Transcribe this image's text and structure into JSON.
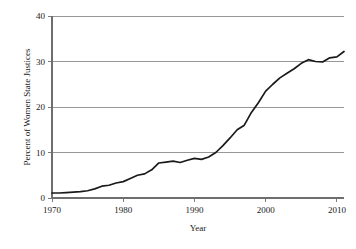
{
  "chart_data": {
    "type": "line",
    "title": "",
    "xlabel": "Year",
    "ylabel": "Percent of Women State Justices",
    "xlim": [
      1970,
      2011
    ],
    "ylim": [
      0,
      40
    ],
    "xticks": [
      1970,
      1980,
      1990,
      2000,
      2010
    ],
    "xtick_labels": [
      "1970",
      "1980",
      "1990",
      "2000",
      "2010"
    ],
    "yticks": [
      0,
      10,
      20,
      30,
      40
    ],
    "ytick_labels": [
      "0",
      "10",
      "20",
      "30",
      "40"
    ],
    "grid": "horizontal",
    "legend": "none",
    "line_color": "#1a1a1a",
    "grid_color": "#8c8c8c",
    "series": [
      {
        "name": "Percent of Women State Justices",
        "x": [
          1970,
          1971,
          1972,
          1973,
          1974,
          1975,
          1976,
          1977,
          1978,
          1979,
          1980,
          1981,
          1982,
          1983,
          1984,
          1985,
          1986,
          1987,
          1988,
          1989,
          1990,
          1991,
          1992,
          1993,
          1994,
          1995,
          1996,
          1997,
          1998,
          1999,
          2000,
          2001,
          2002,
          2003,
          2004,
          2005,
          2006,
          2007,
          2008,
          2009,
          2010
        ],
        "values": [
          1.1,
          1.1,
          1.2,
          1.3,
          1.4,
          1.6,
          2.0,
          2.6,
          2.8,
          3.3,
          3.6,
          4.3,
          5.0,
          5.3,
          6.2,
          7.7,
          7.9,
          8.1,
          7.8,
          8.3,
          8.7,
          8.5,
          9.0,
          10.0,
          11.5,
          13.2,
          15.0,
          16.0,
          18.8,
          21.0,
          23.5,
          25.0,
          26.4,
          27.4,
          28.4,
          29.6,
          30.4,
          30.0,
          29.9,
          30.8,
          31.0
        ]
      }
    ],
    "final_value": 32.2,
    "final_x": 2011
  },
  "axis": {
    "y_title": "Percent of Women State Justices",
    "x_title": "Year"
  }
}
